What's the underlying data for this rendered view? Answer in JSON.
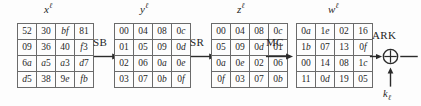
{
  "diagram": {
    "title": "AES round: SubBytes, ShiftRows, MixColumns, AddRoundKey",
    "colors": {
      "background": "#fdfdfd",
      "grid_line": "#6b6b6b",
      "text": "#1f1f1f",
      "arrow": "#2b2b2b"
    },
    "states": [
      {
        "name": "state-x",
        "label_base": "x",
        "label_sup": "ℓ",
        "rows": [
          [
            "52",
            "30",
            "bf",
            "81"
          ],
          [
            "09",
            "36",
            "40",
            "f3"
          ],
          [
            "6a",
            "a5",
            "a3",
            "d7"
          ],
          [
            "d5",
            "38",
            "9e",
            "fb"
          ]
        ]
      },
      {
        "name": "state-y",
        "label_base": "y",
        "label_sup": "ℓ",
        "rows": [
          [
            "00",
            "04",
            "08",
            "0c"
          ],
          [
            "01",
            "05",
            "09",
            "0d"
          ],
          [
            "02",
            "06",
            "0a",
            "0e"
          ],
          [
            "03",
            "07",
            "0b",
            "0f"
          ]
        ]
      },
      {
        "name": "state-z",
        "label_base": "z",
        "label_sup": "ℓ",
        "rows": [
          [
            "00",
            "04",
            "08",
            "0c"
          ],
          [
            "05",
            "09",
            "0d",
            "01"
          ],
          [
            "0a",
            "0e",
            "02",
            "06"
          ],
          [
            "0f",
            "03",
            "07",
            "0b"
          ]
        ]
      },
      {
        "name": "state-w",
        "label_base": "w",
        "label_sup": "ℓ",
        "rows": [
          [
            "0a",
            "1e",
            "02",
            "16"
          ],
          [
            "1b",
            "07",
            "13",
            "0f"
          ],
          [
            "00",
            "14",
            "08",
            "1c"
          ],
          [
            "11",
            "0d",
            "19",
            "05"
          ]
        ]
      }
    ],
    "operations": [
      {
        "name": "op-sb",
        "label": "SB"
      },
      {
        "name": "op-sr",
        "label": "SR"
      },
      {
        "name": "op-mc",
        "label": "MC"
      },
      {
        "name": "op-ark",
        "label": "ARK"
      }
    ],
    "round_key": {
      "base": "k",
      "sub": "ℓ"
    },
    "xor_symbol": "⊕"
  }
}
